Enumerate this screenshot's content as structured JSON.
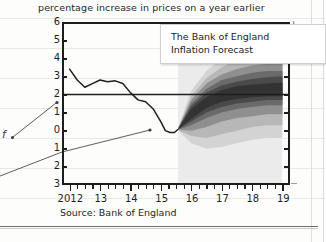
{
  "subtitle": "percentage increase in prices on a year earlier",
  "callout": {
    "line1": "The Bank of England",
    "line2": "Inflation Forecast"
  },
  "source": "Source: Bank of England",
  "margin_annotation": {
    "letter": "f"
  },
  "registration_mark": "+",
  "colors": {
    "axis": "#1d1d1d",
    "line": "#1f1f1f",
    "target_line": "#1f1f1f",
    "forecast_bg": "#ebebeb",
    "band_90": "#d3d3d3",
    "band_75": "#b7b7b7",
    "band_60": "#8f8f8f",
    "band_45": "#6a6a6a",
    "band_30": "#4a4a4a",
    "band_15": "#333333",
    "page": "#fdfdfc"
  },
  "chart_data": {
    "type": "area",
    "title": "The Bank of England Inflation Forecast",
    "subtitle": "percentage increase in prices on a year earlier",
    "xlabel": "",
    "ylabel": "percentage increase in prices on a year earlier",
    "source": "Source: Bank of England",
    "grid": false,
    "legend": "none",
    "xlim": [
      2011.75,
      2019.25
    ],
    "ylim": [
      -3,
      6
    ],
    "y_ticks": [
      6,
      5,
      4,
      3,
      2,
      1,
      0,
      -1,
      -2,
      -3
    ],
    "y_tick_labels": [
      "6",
      "5",
      "4",
      "3",
      "2",
      "1",
      "0",
      "1",
      "2",
      "3"
    ],
    "x_ticks": [
      2012,
      2013,
      2014,
      2015,
      2016,
      2017,
      2018,
      2019
    ],
    "x_tick_labels": [
      "2012",
      "13",
      "14",
      "15",
      "16",
      "17",
      "18",
      "19"
    ],
    "x_minor_tick_interval": 0.25,
    "target_line": {
      "label": "inflation target",
      "value": 2.0,
      "style": "solid"
    },
    "forecast_start": 2015.55,
    "forecast_shading_start": 2015.55,
    "forecast_shading_end": 2019.0,
    "series": [
      {
        "name": "CPI inflation (actual)",
        "type": "line",
        "x": [
          2012.0,
          2012.25,
          2012.5,
          2012.75,
          2013.0,
          2013.25,
          2013.5,
          2013.75,
          2014.0,
          2014.25,
          2014.5,
          2014.75,
          2015.0,
          2015.15,
          2015.3,
          2015.45,
          2015.55
        ],
        "values": [
          3.4,
          2.8,
          2.4,
          2.6,
          2.8,
          2.7,
          2.75,
          2.6,
          2.1,
          1.7,
          1.6,
          1.2,
          0.5,
          0.0,
          -0.1,
          -0.1,
          0.05
        ]
      },
      {
        "name": "Forecast fan central projection",
        "type": "line",
        "x": [
          2015.55,
          2016.0,
          2016.5,
          2017.0,
          2017.5,
          2018.0,
          2018.5,
          2019.0
        ],
        "values": [
          0.05,
          0.9,
          1.6,
          2.0,
          2.1,
          2.15,
          2.2,
          2.2
        ]
      }
    ],
    "fan_bands": [
      {
        "name": "90% confidence interval",
        "probability": 90,
        "color": "#d3d3d3",
        "x": [
          2015.55,
          2016.0,
          2016.5,
          2017.0,
          2017.5,
          2018.0,
          2018.5,
          2019.0
        ],
        "upper": [
          0.05,
          2.2,
          3.3,
          4.0,
          4.4,
          4.7,
          4.9,
          5.0
        ],
        "lower": [
          0.05,
          -0.7,
          -1.0,
          -0.9,
          -0.7,
          -0.5,
          -0.4,
          -0.4
        ]
      },
      {
        "name": "75% confidence interval",
        "probability": 75,
        "color": "#b7b7b7",
        "x": [
          2015.55,
          2016.0,
          2016.5,
          2017.0,
          2017.5,
          2018.0,
          2018.5,
          2019.0
        ],
        "upper": [
          0.05,
          1.9,
          2.9,
          3.5,
          3.9,
          4.1,
          4.3,
          4.3
        ],
        "lower": [
          0.05,
          -0.3,
          -0.4,
          -0.2,
          0.0,
          0.2,
          0.3,
          0.3
        ]
      },
      {
        "name": "60% confidence interval",
        "probability": 60,
        "color": "#8f8f8f",
        "x": [
          2015.55,
          2016.0,
          2016.5,
          2017.0,
          2017.5,
          2018.0,
          2018.5,
          2019.0
        ],
        "upper": [
          0.05,
          1.7,
          2.6,
          3.1,
          3.4,
          3.6,
          3.7,
          3.8
        ],
        "lower": [
          0.05,
          0.0,
          0.2,
          0.5,
          0.7,
          0.8,
          0.9,
          0.9
        ]
      },
      {
        "name": "45% confidence interval",
        "probability": 45,
        "color": "#6a6a6a",
        "x": [
          2015.55,
          2016.0,
          2016.5,
          2017.0,
          2017.5,
          2018.0,
          2018.5,
          2019.0
        ],
        "upper": [
          0.05,
          1.5,
          2.3,
          2.8,
          3.0,
          3.2,
          3.3,
          3.3
        ],
        "lower": [
          0.05,
          0.3,
          0.7,
          1.0,
          1.2,
          1.3,
          1.4,
          1.4
        ]
      },
      {
        "name": "30% confidence interval",
        "probability": 30,
        "color": "#4a4a4a",
        "x": [
          2015.55,
          2016.0,
          2016.5,
          2017.0,
          2017.5,
          2018.0,
          2018.5,
          2019.0
        ],
        "upper": [
          0.05,
          1.35,
          2.1,
          2.5,
          2.7,
          2.85,
          2.95,
          3.0
        ],
        "lower": [
          0.05,
          0.5,
          1.0,
          1.3,
          1.5,
          1.6,
          1.7,
          1.7
        ]
      },
      {
        "name": "15% confidence interval",
        "probability": 15,
        "color": "#333333",
        "x": [
          2015.55,
          2016.0,
          2016.5,
          2017.0,
          2017.5,
          2018.0,
          2018.5,
          2019.0
        ],
        "upper": [
          0.05,
          1.2,
          1.85,
          2.25,
          2.45,
          2.55,
          2.6,
          2.65
        ],
        "lower": [
          0.05,
          0.65,
          1.25,
          1.6,
          1.75,
          1.85,
          1.9,
          1.9
        ]
      }
    ]
  }
}
